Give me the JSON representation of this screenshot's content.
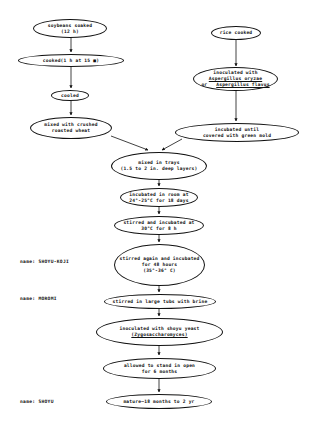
{
  "diagram": {
    "type": "flowchart",
    "nodes": {
      "soybeans_soaked": {
        "l1": "soybeans soaked",
        "l2": "(12 h)"
      },
      "cooked": {
        "l1": "cooked(1 h at 15 ■)"
      },
      "cooled": {
        "l1": "cooled"
      },
      "mixed_wheat": {
        "l1": "mixed with crushed",
        "l2": "roasted wheat"
      },
      "rice_cooked": {
        "l1": "rice cooked"
      },
      "inoculated_asp": {
        "l1": "inoculated with",
        "l2": "Aspergillus oryzae",
        "l3_prefix": "or",
        "l3": "Aspergillus flavus"
      },
      "incubated_mold": {
        "l1": "incubated until",
        "l2": "covered with green mold"
      },
      "mixed_trays": {
        "l1": "mixed in trays",
        "l2": "(1.5 to 2 in. deep layers)"
      },
      "incubated_room": {
        "l1": "incubated in room at",
        "l2": "24°-25°C for 18 days"
      },
      "stirred_30": {
        "l1": "stirred and incubated at",
        "l2": "30°C for 8 h"
      },
      "stirred_again": {
        "l1": "stirred again and incubated",
        "l2": "for 48 hours",
        "l3": "(35°-36° C)"
      },
      "stirred_tubs": {
        "l1": "stirred in large tubs with brine"
      },
      "inoculated_yeast": {
        "l1": "inoculated with shoyu yeast",
        "l2": "(Zygosaccharomyces)"
      },
      "allowed_stand": {
        "l1": "allowed to stand in open",
        "l2": "for 6 months"
      },
      "mature": {
        "l1": "mature—18 months to 2 yr"
      }
    },
    "side_labels": {
      "koji": "name: SHOYU-KOJI",
      "moromi": "name: MOROMI",
      "shoyu": "name: SHOYU"
    },
    "edges": [
      [
        "soybeans_soaked",
        "cooked"
      ],
      [
        "cooked",
        "cooled"
      ],
      [
        "cooled",
        "mixed_wheat"
      ],
      [
        "rice_cooked",
        "inoculated_asp"
      ],
      [
        "inoculated_asp",
        "incubated_mold"
      ],
      [
        "mixed_wheat",
        "mixed_trays"
      ],
      [
        "incubated_mold",
        "mixed_trays"
      ],
      [
        "mixed_trays",
        "incubated_room"
      ],
      [
        "incubated_room",
        "stirred_30"
      ],
      [
        "stirred_30",
        "stirred_again"
      ],
      [
        "stirred_again",
        "stirred_tubs"
      ],
      [
        "stirred_tubs",
        "inoculated_yeast"
      ],
      [
        "inoculated_yeast",
        "allowed_stand"
      ],
      [
        "allowed_stand",
        "mature"
      ]
    ]
  }
}
